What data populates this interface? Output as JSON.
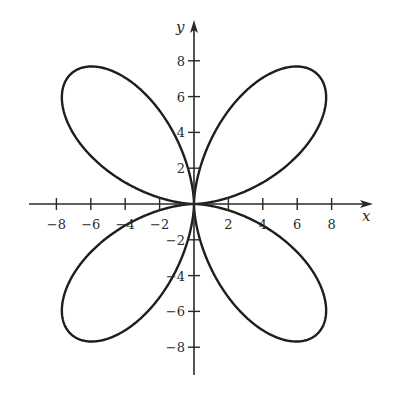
{
  "chart_data": {
    "type": "line",
    "subtype": "polar-rose",
    "title": "",
    "xlabel": "x",
    "ylabel": "y",
    "xlim": [
      -9,
      9
    ],
    "ylim": [
      -9,
      9
    ],
    "grid": false,
    "legend": null,
    "x_ticks": [
      -8,
      -6,
      -4,
      -2,
      2,
      4,
      6,
      8
    ],
    "y_ticks": [
      -8,
      -6,
      -4,
      -2,
      2,
      4,
      6,
      8
    ],
    "x_tick_labels": [
      "−8",
      "−6",
      "−4",
      "−2",
      "2",
      "4",
      "6",
      "8"
    ],
    "y_tick_labels": [
      "−8",
      "−6",
      "−4",
      "−2",
      "2",
      "4",
      "6",
      "8"
    ],
    "curve_model": {
      "form": "r = R·|sin(2θ)|^p",
      "R": 10.2,
      "p": 1.5
    },
    "series": [
      {
        "name": "petal-quadrant-I",
        "extreme_points": {
          "top": [
            5.9,
            7.7
          ],
          "right": [
            7.7,
            5.5
          ]
        }
      },
      {
        "name": "petal-quadrant-II",
        "extreme_points": {
          "top": [
            -5.4,
            7.7
          ],
          "left": [
            -7.6,
            5.5
          ]
        }
      },
      {
        "name": "petal-quadrant-III",
        "extreme_points": {
          "bottom": [
            -5.5,
            -7.7
          ],
          "left": [
            -7.6,
            -5.5
          ]
        }
      },
      {
        "name": "petal-quadrant-IV",
        "extreme_points": {
          "bottom": [
            5.9,
            -7.6
          ],
          "right": [
            7.7,
            -5.5
          ]
        }
      }
    ],
    "colors": {
      "curve": "#1e1e1e",
      "axes": "#2a2a2a",
      "background": "#ffffff"
    }
  },
  "layout": {
    "origin_px": [
      194,
      204
    ],
    "px_per_unit_x": 17.2,
    "px_per_unit_y": 17.9,
    "x_axis_px": [
      29,
      373
    ],
    "y_axis_px": [
      20,
      375
    ]
  }
}
